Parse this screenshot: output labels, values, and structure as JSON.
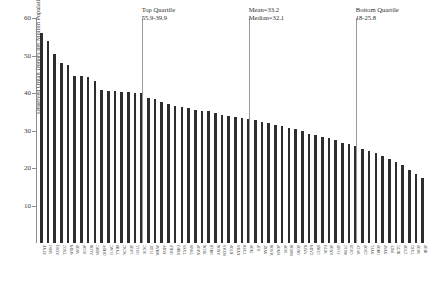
{
  "chart_data": {
    "type": "bar",
    "title": "",
    "xlabel": "",
    "ylabel": "Observed Organ Donors per Million Population",
    "ylim": [
      0,
      60
    ],
    "yticks": [
      10,
      20,
      30,
      40,
      50,
      60
    ],
    "grid": false,
    "legend": null,
    "categories": [
      "STNY",
      "MSKI",
      "AZOQ",
      "TXGC",
      "WIDN",
      "MIOP",
      "SCOP",
      "ALOB",
      "MDPC",
      "OHOV",
      "FLWC",
      "TNDS",
      "NCNC",
      "LAOP",
      "GALL",
      "SCSC",
      "FLUF",
      "WIUW",
      "PADV",
      "OHLP",
      "ORUO",
      "TXSA",
      "TNMS",
      "NMOP",
      "NEOR",
      "OHLB",
      "AROR",
      "MOMA",
      "UTOP",
      "KYDA",
      "TXSB",
      "INOP",
      "ILIP",
      "NYRT",
      "MAOB",
      "MNOP",
      "IAOP",
      "MWOB",
      "OKOP",
      "VATB",
      "CADN",
      "CORS",
      "NJTO",
      "KYOP",
      "FLMP",
      "WALC",
      "CAGS",
      "NVLV",
      "CAOP",
      "NYFL",
      "OHOP",
      "NYAP",
      "PATF",
      "DCTC",
      "CTOP",
      "TXSG",
      "MIOP",
      "HIOP"
    ],
    "values": [
      55.9,
      54.0,
      50.3,
      48.0,
      47.5,
      44.6,
      44.5,
      44.3,
      43.2,
      40.9,
      40.6,
      40.5,
      40.4,
      40.3,
      40.0,
      39.9,
      38.6,
      38.4,
      37.6,
      37.2,
      36.6,
      36.2,
      36.0,
      35.6,
      35.3,
      35.2,
      34.6,
      34.2,
      33.8,
      33.6,
      33.3,
      33.2,
      32.8,
      32.4,
      32.1,
      31.6,
      31.2,
      30.8,
      30.4,
      30.0,
      29.2,
      28.8,
      28.3,
      27.9,
      27.4,
      26.8,
      26.3,
      25.8,
      25.2,
      24.6,
      24.0,
      23.2,
      22.4,
      21.6,
      20.7,
      19.6,
      18.5,
      17.3
    ],
    "annotations": [
      {
        "name": "top-quartile",
        "line1": "Top Quartile",
        "line2": "55.9-39.9",
        "at_index": 15
      },
      {
        "name": "mean-median",
        "line1": "Mean=33.2",
        "line2": "Median=32.1",
        "at_index": 31
      },
      {
        "name": "bottom-quartile",
        "line1": "Bottom Quartile",
        "line2": "18-25.8",
        "at_index": 47
      }
    ],
    "mean": 33.2,
    "median": 32.1,
    "top_quartile_range": "55.9-39.9",
    "bottom_quartile_range": "18-25.8",
    "bar_color": "#2e2e2e",
    "axis_color": "#8d8d8d",
    "marker_line_color": "#9a9a9a"
  }
}
